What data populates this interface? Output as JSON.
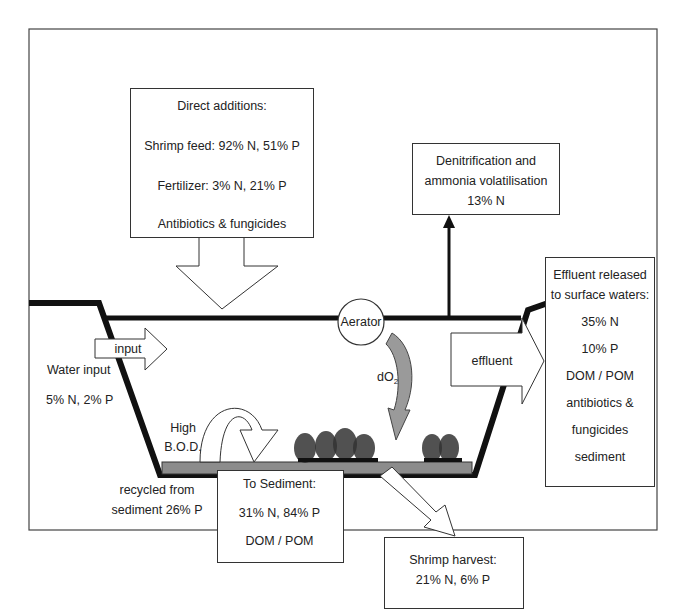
{
  "diagram": {
    "direct_additions": {
      "heading": "Direct additions:",
      "shrimp_feed": "Shrimp feed: 92% N, 51% P",
      "fertilizer": "Fertilizer: 3% N, 21% P",
      "chemicals": "Antibiotics & fungicides"
    },
    "denitrification": {
      "line1": "Denitrification and",
      "line2": "ammonia volatilisation",
      "line3": "13% N"
    },
    "effluent_released": {
      "line1": "Effluent released",
      "line2": "to surface waters:",
      "n": "35% N",
      "p": "10% P",
      "organic": "DOM / POM",
      "chem1": "antibiotics &",
      "chem2": "fungicides",
      "sediment": "sediment"
    },
    "input_arrow": "input",
    "effluent_arrow": "effluent",
    "water_input": {
      "label": "Water input",
      "values": "5% N, 2% P"
    },
    "aerator": "Aerator",
    "do2": {
      "main": "dO",
      "sub": "2"
    },
    "high_bod": {
      "line1": "High",
      "line2": "B.O.D."
    },
    "recycled": {
      "line1": "recycled from",
      "line2": "sediment 26% P"
    },
    "to_sediment": {
      "heading": "To Sediment:",
      "values": "31% N, 84% P",
      "organic": "DOM / POM"
    },
    "shrimp_harvest": {
      "heading": "Shrimp harvest:",
      "values": "21% N, 6% P"
    },
    "colors": {
      "line": "#111111",
      "sediment": "#8c8c8c",
      "do2_arrow": "#9a9a9a",
      "box_border": "#333333",
      "background": "#ffffff"
    }
  }
}
